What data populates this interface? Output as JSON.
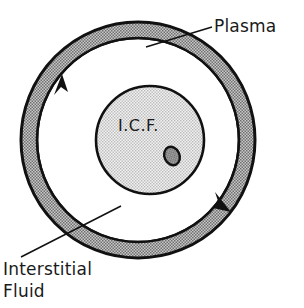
{
  "figure": {
    "background_color": "#ffffff",
    "ink_color": "#1a1a1a"
  },
  "labels": {
    "plasma": "Plasma",
    "interstitial_line1": "Interstitial",
    "interstitial_line2": "Fluid",
    "icf": "I.C.F."
  },
  "compartments": [
    {
      "name": "plasma",
      "label": "Plasma",
      "shape": "annulus",
      "fill": "#b3b3b3",
      "stroke": "#111111",
      "center": [
        138,
        140
      ],
      "outer_radius": 117,
      "inner_radius": 101
    },
    {
      "name": "interstitial-fluid",
      "label": "Interstitial Fluid",
      "shape": "ring-region",
      "fill": "#ffffff",
      "stroke": "#111111",
      "center": [
        138,
        140
      ],
      "outer_radius": 101,
      "inner_radius": 54
    },
    {
      "name": "intracellular-fluid",
      "label": "I.C.F.",
      "shape": "circle",
      "fill": "#d4d4d4",
      "stroke": "#111111",
      "center": [
        150,
        140
      ],
      "radius": 54
    },
    {
      "name": "nucleus",
      "label": "",
      "shape": "ellipse",
      "fill": "#9a9a9a",
      "stroke": "#111111",
      "center": [
        172,
        156
      ],
      "radius_x": 8,
      "radius_y": 10,
      "rotation_deg": -25
    }
  ],
  "arrows": [
    {
      "name": "flow-arrow-left",
      "direction": "counterclockwise-up",
      "position": [
        59,
        78
      ],
      "color": "#111111"
    },
    {
      "name": "flow-arrow-right",
      "direction": "counterclockwise-down",
      "position": [
        227,
        205
      ],
      "color": "#111111"
    }
  ],
  "leader_lines": [
    {
      "name": "plasma-leader",
      "from": [
        211,
        28
      ],
      "to": [
        148,
        47
      ],
      "color": "#111111"
    },
    {
      "name": "interstitial-leader",
      "from": [
        22,
        256
      ],
      "to": [
        120,
        207
      ],
      "color": "#111111"
    }
  ]
}
